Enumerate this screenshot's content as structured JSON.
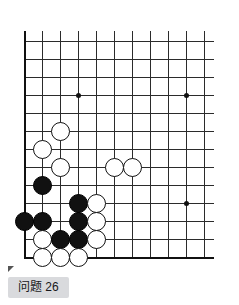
{
  "caption": {
    "label": "问题 26"
  },
  "board": {
    "title": "go-board-diagram",
    "origin_x": 24,
    "origin_y": 41,
    "spacing": 18,
    "cols": 11,
    "rows": 13,
    "line_color": "#2b2b2b",
    "edge_color": "#111111",
    "background": "#ffffff",
    "star_points": [
      {
        "col": 4,
        "row": 4
      },
      {
        "col": 10,
        "row": 4
      },
      {
        "col": 10,
        "row": 10
      }
    ],
    "stones": [
      {
        "color": "white",
        "col": 3,
        "row": 6
      },
      {
        "color": "white",
        "col": 2,
        "row": 7
      },
      {
        "color": "white",
        "col": 3,
        "row": 8
      },
      {
        "color": "white",
        "col": 6,
        "row": 8
      },
      {
        "color": "white",
        "col": 7,
        "row": 8
      },
      {
        "color": "black",
        "col": 2,
        "row": 9
      },
      {
        "color": "black",
        "col": 4,
        "row": 10
      },
      {
        "color": "white",
        "col": 5,
        "row": 10
      },
      {
        "color": "black",
        "col": 1,
        "row": 11
      },
      {
        "color": "black",
        "col": 2,
        "row": 11
      },
      {
        "color": "black",
        "col": 4,
        "row": 11
      },
      {
        "color": "white",
        "col": 5,
        "row": 11
      },
      {
        "color": "white",
        "col": 2,
        "row": 12
      },
      {
        "color": "black",
        "col": 3,
        "row": 12
      },
      {
        "color": "black",
        "col": 4,
        "row": 12
      },
      {
        "color": "white",
        "col": 5,
        "row": 12
      },
      {
        "color": "white",
        "col": 2,
        "row": 13
      },
      {
        "color": "white",
        "col": 3,
        "row": 13
      },
      {
        "color": "white",
        "col": 4,
        "row": 13
      }
    ]
  }
}
